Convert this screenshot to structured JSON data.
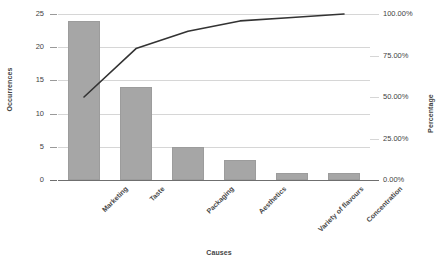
{
  "chart_data": {
    "type": "bar",
    "title": "",
    "subtitle": "",
    "xlabel": "Causes",
    "ylabel": "Occurrences",
    "y2label": "Percentage",
    "categories": [
      "Marketing",
      "Taste",
      "Packaging",
      "Aesthetics",
      "Variety of flavours",
      "Concentration"
    ],
    "series": [
      {
        "name": "Occurrences",
        "type": "bar",
        "axis": "left",
        "values": [
          24,
          14,
          5,
          3,
          1,
          1
        ]
      },
      {
        "name": "Cumulative Percentage",
        "type": "line",
        "axis": "right",
        "values": [
          50.0,
          79.17,
          89.58,
          95.83,
          97.92,
          100.0
        ]
      }
    ],
    "total_occurrences": 48,
    "ylim": [
      0,
      25
    ],
    "y2lim": [
      0,
      100
    ],
    "yticks": [
      0,
      5,
      10,
      15,
      20,
      25
    ],
    "ytick_labels": [
      "0",
      "5",
      "10",
      "15",
      "20",
      "25"
    ],
    "y2ticks": [
      0,
      25,
      50,
      75,
      100
    ],
    "y2tick_labels": [
      "0.00%",
      "25.00%",
      "50.00%",
      "75.00%",
      "100.00%"
    ],
    "grid": true,
    "legend": false,
    "legend_position": "none",
    "bar_color": "#a6a6a6",
    "line_color": "#333333",
    "grid_color": "#d6d6d6",
    "axis_color": "#6f6f6f",
    "background_color": "#ffffff",
    "text_color": "#3f3f3f"
  }
}
